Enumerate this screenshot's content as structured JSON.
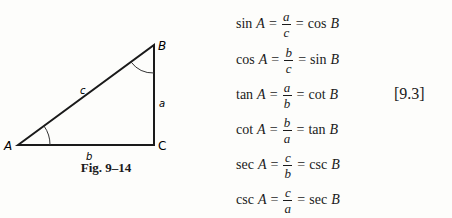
{
  "figure": {
    "caption": "Fig. 9–14",
    "vertices": {
      "A": {
        "label": "A",
        "x": 18,
        "y": 145
      },
      "B": {
        "label": "B",
        "x": 154,
        "y": 45
      },
      "C": {
        "label": "C",
        "x": 154,
        "y": 145
      }
    },
    "sides": {
      "a": "a",
      "b": "b",
      "c": "c"
    },
    "line_color": "#1a1a1a"
  },
  "formulas": [
    {
      "fn": "sin",
      "var": "A",
      "num": "a",
      "den": "c",
      "rhs_fn": "cos",
      "rhs_var": "B"
    },
    {
      "fn": "cos",
      "var": "A",
      "num": "b",
      "den": "c",
      "rhs_fn": "sin",
      "rhs_var": "B"
    },
    {
      "fn": "tan",
      "var": "A",
      "num": "a",
      "den": "b",
      "rhs_fn": "cot",
      "rhs_var": "B"
    },
    {
      "fn": "cot",
      "var": "A",
      "num": "b",
      "den": "a",
      "rhs_fn": "tan",
      "rhs_var": "B"
    },
    {
      "fn": "sec",
      "var": "A",
      "num": "c",
      "den": "b",
      "rhs_fn": "csc",
      "rhs_var": "B"
    },
    {
      "fn": "csc",
      "var": "A",
      "num": "c",
      "den": "a",
      "rhs_fn": "sec",
      "rhs_var": "B"
    }
  ],
  "symbols": {
    "equals": "="
  },
  "equation_number": "[9.3]"
}
